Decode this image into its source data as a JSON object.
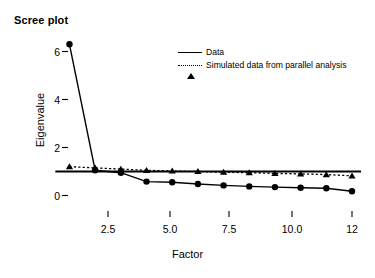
{
  "title": "Scree plot",
  "axes": {
    "xlabel": "Factor",
    "ylabel": "Eigenvalue",
    "xticks": [
      "2.5",
      "5.0",
      "7.5",
      "10.0",
      "12"
    ],
    "yticks": [
      "6",
      "4",
      "2",
      "0"
    ]
  },
  "legend": {
    "items": [
      {
        "label": "Data",
        "marker": "circle-marker-icon",
        "line": "solid",
        "color": "#000000"
      },
      {
        "label": "Simulated data from parallel analysis",
        "marker": "triangle-marker-icon",
        "line": "dotted",
        "color": "#000000"
      }
    ]
  },
  "chart_data": {
    "type": "line",
    "title": "Scree plot",
    "xlabel": "Factor",
    "ylabel": "Eigenvalue",
    "xlim": [
      0.4,
      12.3
    ],
    "ylim": [
      -0.25,
      6.8
    ],
    "xticks": [
      2.5,
      5.0,
      7.5,
      10.0,
      12
    ],
    "yticks": [
      0,
      2,
      4,
      6
    ],
    "grid": false,
    "legend_position": "upper-center-right",
    "x": [
      1,
      2,
      3,
      4,
      5,
      6,
      7,
      8,
      9,
      10,
      11,
      12
    ],
    "series": [
      {
        "name": "Data",
        "marker": "circle",
        "linestyle": "solid",
        "values": [
          6.3,
          1.05,
          0.95,
          0.58,
          0.55,
          0.48,
          0.42,
          0.38,
          0.35,
          0.32,
          0.3,
          0.18
        ]
      },
      {
        "name": "Simulated data from parallel analysis",
        "marker": "triangle",
        "linestyle": "dotted",
        "values": [
          1.2,
          1.15,
          1.1,
          1.05,
          1.02,
          1.0,
          0.97,
          0.95,
          0.92,
          0.9,
          0.87,
          0.82
        ]
      }
    ],
    "reference_line": {
      "orientation": "horizontal",
      "y": 1.0,
      "linestyle": "solid"
    }
  }
}
